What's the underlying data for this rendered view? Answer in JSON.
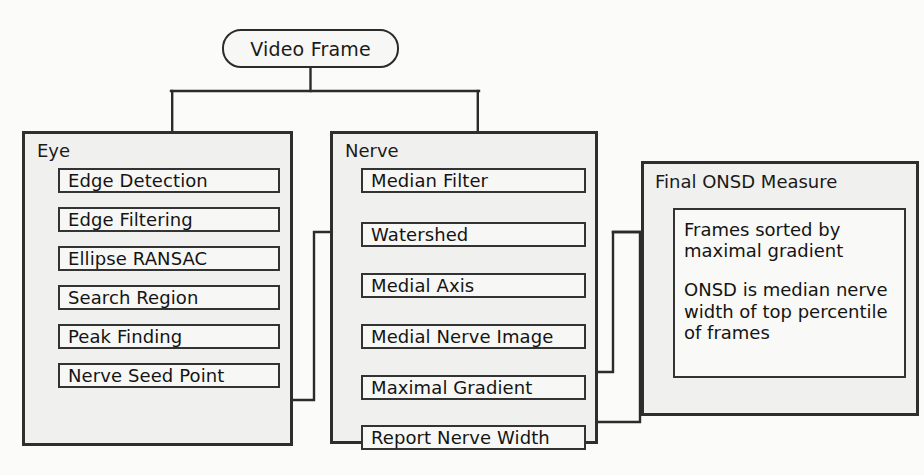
{
  "diagram": {
    "start_node": {
      "label": "Video Frame",
      "shape": "rounded-rectangle"
    },
    "groups": [
      {
        "id": "eye",
        "title": "Eye",
        "steps": [
          {
            "label": "Edge Detection"
          },
          {
            "label": "Edge Filtering"
          },
          {
            "label": "Ellipse RANSAC"
          },
          {
            "label": "Search Region"
          },
          {
            "label": "Peak Finding"
          },
          {
            "label": "Nerve Seed Point"
          }
        ]
      },
      {
        "id": "nerve",
        "title": "Nerve",
        "steps": [
          {
            "label": "Median Filter"
          },
          {
            "label": "Watershed"
          },
          {
            "label": "Medial Axis"
          },
          {
            "label": "Medial Nerve Image"
          },
          {
            "label": "Maximal Gradient"
          },
          {
            "label": "Report Nerve Width"
          }
        ]
      },
      {
        "id": "final",
        "title": "Final ONSD Measure",
        "paragraphs": [
          "Frames sorted by maximal gradient",
          "ONSD is median nerve width of top percentile of frames"
        ]
      }
    ],
    "colors": {
      "page_background": "#fbfbfa",
      "group_fill": "#f0f0ee",
      "group_border": "#2e2e2e",
      "step_fill": "#f7f7f5",
      "step_border": "#333333",
      "connector": "#2b2b2b",
      "text": "#141414"
    }
  }
}
